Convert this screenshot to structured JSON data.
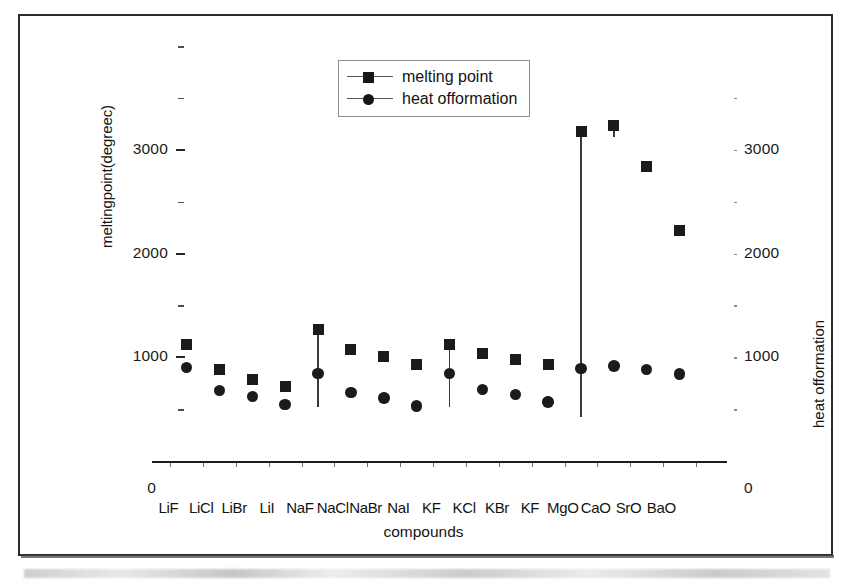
{
  "chart_data": {
    "type": "scatter",
    "title": "",
    "xlabel": "compounds",
    "ylabel": "meltingpoint(degreec)",
    "y2label": "heat offormation",
    "ylim": [
      0,
      4000
    ],
    "y2lim": [
      0,
      4000
    ],
    "yticks": [
      0,
      1000,
      2000,
      3000
    ],
    "y2ticks": [
      0,
      1000,
      2000,
      3000
    ],
    "grid": false,
    "legend_position": "top-center",
    "categories": [
      "LiF",
      "LiCl",
      "LiBr",
      "LiI",
      "NaF",
      "NaCl",
      "NaBr",
      "NaI",
      "KF",
      "KCl",
      "KBr",
      "KF",
      "MgO",
      "CaO",
      "SrO",
      "BaO"
    ],
    "series": [
      {
        "name": "melting point",
        "marker": "square",
        "color": "#1b1b1b",
        "values": [
          1120,
          880,
          790,
          720,
          1265,
          1075,
          1010,
          930,
          1120,
          1040,
          980,
          930,
          3175,
          3235,
          2840,
          2220
        ]
      },
      {
        "name": "heat offormation",
        "marker": "circle",
        "color": "#1b1b1b",
        "values": [
          900,
          680,
          620,
          545,
          845,
          660,
          605,
          530,
          845,
          690,
          640,
          570,
          890,
          915,
          880,
          840
        ]
      }
    ]
  },
  "legend": {
    "entries": [
      {
        "label": "melting point",
        "marker": "square-marker"
      },
      {
        "label": "heat offormation",
        "marker": "circle-marker"
      }
    ]
  },
  "axes": {
    "left": {
      "title": "meltingpoint(degreec)",
      "tick_labels": [
        "3000",
        "2000",
        "1000"
      ],
      "origin_label": "0"
    },
    "right": {
      "title": "heat offormation",
      "tick_labels": [
        "3000",
        "2000",
        "1000"
      ],
      "origin_label": "0"
    },
    "bottom": {
      "title": "compounds"
    }
  }
}
